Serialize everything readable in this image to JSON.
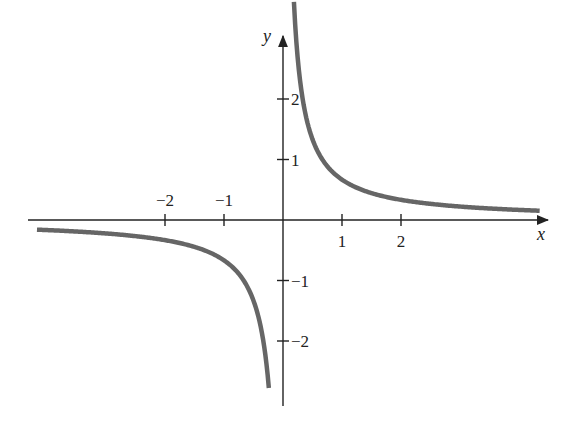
{
  "chart_data": {
    "type": "line",
    "title": "",
    "function": "y = 2/(3x)",
    "xlabel": "x",
    "ylabel": "y",
    "xlim": [
      -4.2,
      4.4
    ],
    "ylim": [
      -3.05,
      3.0
    ],
    "grid": false,
    "x_ticks": [
      -2,
      -1,
      1,
      2
    ],
    "x_tick_labels": [
      "−2",
      "−1",
      "1",
      "2"
    ],
    "y_ticks": [
      2,
      1,
      -1,
      -2
    ],
    "y_tick_labels": [
      "2",
      "1",
      "−1",
      "−2"
    ],
    "series": [
      {
        "name": "right-branch",
        "x": [
          0.18,
          0.25,
          0.35,
          0.5,
          0.75,
          1,
          1.5,
          2,
          2.5,
          3,
          3.5,
          4.3
        ],
        "y": [
          3.7,
          2.67,
          1.9,
          1.33,
          0.89,
          0.67,
          0.44,
          0.33,
          0.27,
          0.22,
          0.19,
          0.155
        ]
      },
      {
        "name": "left-branch",
        "x": [
          -4.1,
          -3.5,
          -3,
          -2.5,
          -2,
          -1.5,
          -1,
          -0.75,
          -0.5,
          -0.35,
          -0.28
        ],
        "y": [
          -0.16,
          -0.19,
          -0.22,
          -0.27,
          -0.33,
          -0.44,
          -0.67,
          -0.89,
          -1.33,
          -1.9,
          -2.9
        ]
      }
    ],
    "colors": {
      "curve": "#666666",
      "axes": "#222222"
    }
  }
}
